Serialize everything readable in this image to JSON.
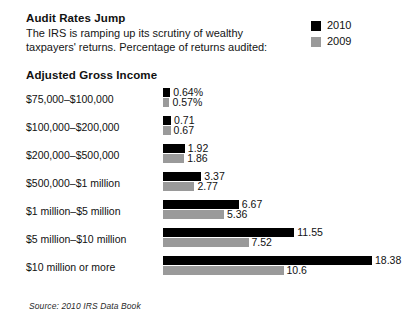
{
  "header": {
    "title": "Audit Rates Jump",
    "subtitle_line1": "The IRS is ramping up its scrutiny of wealthy",
    "subtitle_line2": "taxpayers' returns. Percentage of returns audited:"
  },
  "legend": {
    "items": [
      {
        "label": "2010",
        "color": "#000000"
      },
      {
        "label": "2009",
        "color": "#9a9a9a"
      }
    ]
  },
  "axis": {
    "category_header": "Adjusted Gross Income"
  },
  "source": {
    "text": "Source: 2010 IRS Data Book"
  },
  "colors": {
    "series_2010": "#000000",
    "series_2009": "#9a9a9a",
    "background": "#ffffff",
    "text": "#111111"
  },
  "chart_data": {
    "type": "bar",
    "orientation": "horizontal",
    "title": "Audit Rates Jump",
    "subtitle": "The IRS is ramping up its scrutiny of wealthy taxpayers' returns. Percentage of returns audited:",
    "xlabel": "Percentage of returns audited",
    "ylabel": "Adjusted Gross Income",
    "grid": false,
    "legend_position": "top-right",
    "xlim": [
      0,
      18.38
    ],
    "categories": [
      "$75,000–$100,000",
      "$100,000–$200,000",
      "$200,000–$500,000",
      "$500,000–$1 million",
      "$1 million–$5 million",
      "$5 million–$10 million",
      "$10 million or more"
    ],
    "series": [
      {
        "name": "2010",
        "color": "#000000",
        "values": [
          0.64,
          0.71,
          1.92,
          3.37,
          6.67,
          11.55,
          18.38
        ],
        "labels": [
          "0.64%",
          "0.71",
          "1.92",
          "3.37",
          "6.67",
          "11.55",
          "18.38"
        ]
      },
      {
        "name": "2009",
        "color": "#9a9a9a",
        "values": [
          0.57,
          0.67,
          1.86,
          2.77,
          5.36,
          7.52,
          10.6
        ],
        "labels": [
          "0.57%",
          "0.67",
          "1.86",
          "2.77",
          "5.36",
          "7.52",
          "10.6"
        ]
      }
    ],
    "source": "Source: 2010 IRS Data Book"
  },
  "scale": {
    "px_per_unit": 11.37,
    "min_bar_px": 5
  }
}
